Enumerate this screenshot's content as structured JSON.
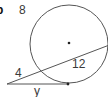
{
  "diagram": {
    "part_label": "b",
    "answer_number": "8",
    "segment_labels": {
      "secant_external": "4",
      "secant_internal": "12",
      "tangent": "y"
    },
    "colors": {
      "stroke": "#4a4a4a",
      "text": "#3a3a3a",
      "background": "#ffffff"
    }
  }
}
